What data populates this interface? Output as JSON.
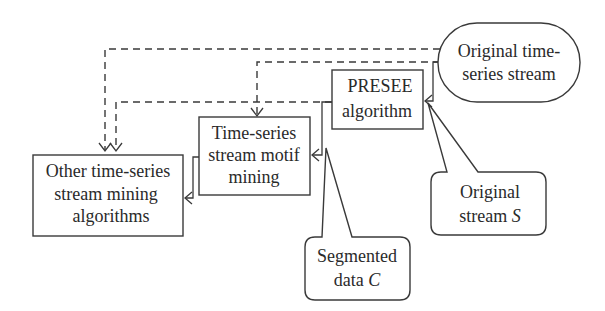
{
  "diagram": {
    "nodes": {
      "original_stream": {
        "lines": [
          "Original time-",
          "series stream"
        ],
        "shape": "rounded-pill"
      },
      "presee": {
        "lines": [
          "PRESEE",
          "algorithm"
        ],
        "shape": "rectangle"
      },
      "motif_mining": {
        "lines": [
          "Time-series",
          "stream motif",
          "mining"
        ],
        "shape": "rectangle"
      },
      "other_algorithms": {
        "lines": [
          "Other time-series",
          "stream mining",
          "algorithms"
        ],
        "shape": "rectangle"
      }
    },
    "callouts": {
      "original_stream_s": {
        "line1": "Original",
        "line2_prefix": "stream ",
        "line2_var": "S"
      },
      "segmented_data_c": {
        "line1": "Segmented",
        "line2_prefix": "data ",
        "line2_var": "C"
      }
    },
    "edges": [
      {
        "from": "original_stream",
        "to": "other_algorithms",
        "style": "dashed"
      },
      {
        "from": "original_stream",
        "to": "motif_mining",
        "style": "dashed"
      },
      {
        "from": "original_stream",
        "to": "presee",
        "style": "solid"
      },
      {
        "from": "presee",
        "to": "other_algorithms",
        "style": "dashed"
      },
      {
        "from": "presee",
        "to": "motif_mining",
        "style": "solid"
      },
      {
        "from": "motif_mining",
        "to": "other_algorithms",
        "style": "solid"
      }
    ],
    "colors": {
      "stroke": "#3a3a3a",
      "text": "#2a2a2a",
      "background": "#ffffff"
    }
  }
}
